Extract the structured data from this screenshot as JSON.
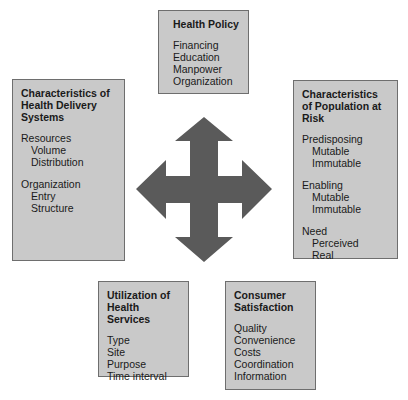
{
  "diagram": {
    "center_symbol": "four-way-arrow-icon",
    "colors": {
      "box_fill": "#c9c9c9",
      "box_border": "#6e6e6e",
      "arrow_fill": "#5a5a5a",
      "background": "#ffffff"
    },
    "boxes": {
      "health_policy": {
        "title": "Health Policy",
        "items": [
          "Financing",
          "Education",
          "Manpower",
          "Organization"
        ]
      },
      "delivery_systems": {
        "title": "Characteristics of Health Delivery Systems",
        "groups": [
          {
            "label": "Resources",
            "subitems": [
              "Volume",
              "Distribution"
            ]
          },
          {
            "label": "Organization",
            "subitems": [
              "Entry",
              "Structure"
            ]
          }
        ]
      },
      "population_at_risk": {
        "title": "Characteristics of Population at Risk",
        "groups": [
          {
            "label": "Predisposing",
            "subitems": [
              "Mutable",
              "Immutable"
            ]
          },
          {
            "label": "Enabling",
            "subitems": [
              "Mutable",
              "Immutable"
            ]
          },
          {
            "label": "Need",
            "subitems": [
              "Perceived",
              "Real"
            ]
          }
        ]
      },
      "utilization": {
        "title": "Utilization of Health Services",
        "items": [
          "Type",
          "Site",
          "Purpose",
          "Time interval"
        ]
      },
      "consumer_satisfaction": {
        "title": "Consumer Satisfaction",
        "items": [
          "Quality",
          "Convenience",
          "Costs",
          "Coordination",
          "Information"
        ]
      }
    }
  }
}
